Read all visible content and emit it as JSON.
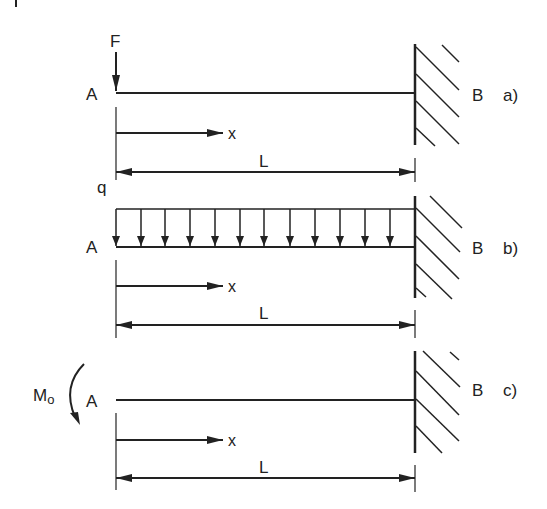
{
  "diagram": {
    "colors": {
      "ink": "#222222",
      "background": "#ffffff"
    },
    "corner_mark": "|",
    "cases": [
      {
        "id": "a",
        "case_label": "a)",
        "free_end_label": "A",
        "fixed_end_label": "B",
        "load_type": "point force",
        "load_label": "F",
        "coord_label": "x",
        "length_label": "L"
      },
      {
        "id": "b",
        "case_label": "b)",
        "free_end_label": "A",
        "fixed_end_label": "B",
        "load_type": "uniformly distributed load",
        "load_label": "q",
        "load_arrow_count": 12,
        "coord_label": "x",
        "length_label": "L"
      },
      {
        "id": "c",
        "case_label": "c)",
        "free_end_label": "A",
        "fixed_end_label": "B",
        "load_type": "end moment",
        "load_label": "M",
        "load_label_sub": "o",
        "coord_label": "x",
        "length_label": "L"
      }
    ]
  }
}
